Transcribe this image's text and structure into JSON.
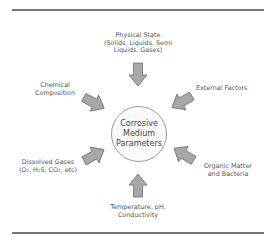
{
  "diagram": {
    "center": {
      "line1": "Corrosive",
      "line2": "Medium",
      "line3": "Parameters"
    },
    "factors": [
      {
        "name": "physical-state",
        "lines": [
          "Physical State",
          "(Solids, Liquids, Semi",
          "Liquids, Gases)"
        ]
      },
      {
        "name": "chemical-composition",
        "lines": [
          "Chemical",
          "Composition"
        ]
      },
      {
        "name": "external-factors",
        "lines": [
          "External Factors"
        ]
      },
      {
        "name": "dissolved-gases",
        "lines": [
          "Dissolved Gases",
          "(O₂, H₂S, CO₂, etc)"
        ]
      },
      {
        "name": "organic-matter",
        "lines": [
          "Organic Matter",
          "and Bacteria"
        ]
      },
      {
        "name": "temperature",
        "lines": [
          "Temperature, pH,",
          "Conductivity"
        ]
      }
    ],
    "colors": {
      "arrow_fill": "#a8a8a8",
      "arrow_stroke": "#6e6e6e",
      "circle_border": "#999999",
      "rule": "#777777"
    }
  }
}
